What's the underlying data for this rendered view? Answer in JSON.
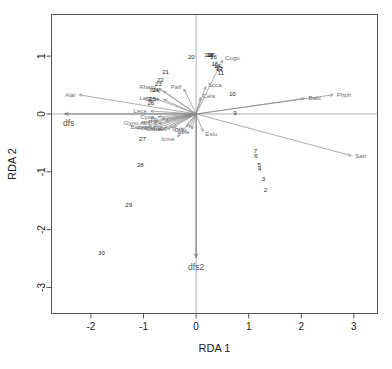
{
  "chart_data": {
    "type": "scatter",
    "title": "",
    "xlabel": "RDA 1",
    "ylabel": "RDA 2",
    "xlim": [
      -2.75,
      3.45
    ],
    "ylim": [
      -3.45,
      1.72
    ],
    "xticks": [
      "-2",
      "-1",
      "0",
      "1",
      "2",
      "3"
    ],
    "xtick_values": [
      -2,
      -1,
      0,
      1,
      2,
      3
    ],
    "yticks": [
      "1",
      "0",
      "-1",
      "-2",
      "-3"
    ],
    "ytick_values": [
      1,
      0,
      -1,
      -2,
      -3
    ],
    "grid": false,
    "legend": "none",
    "zero_lines": true,
    "sites": [
      {
        "label": "1",
        "x": 0.3,
        "y": 1.02
      },
      {
        "label": "2",
        "x": 1.32,
        "y": -1.3
      },
      {
        "label": "3",
        "x": 1.28,
        "y": -1.12
      },
      {
        "label": "4",
        "x": 1.21,
        "y": -0.94
      },
      {
        "label": "5",
        "x": 1.2,
        "y": -0.88
      },
      {
        "label": "6",
        "x": 1.14,
        "y": -0.71
      },
      {
        "label": "7",
        "x": 1.13,
        "y": -0.63
      },
      {
        "label": "9",
        "x": 0.74,
        "y": 0.02
      },
      {
        "label": "10",
        "x": 0.69,
        "y": 0.36
      },
      {
        "label": "11",
        "x": 0.47,
        "y": 0.72
      },
      {
        "label": "12",
        "x": 0.45,
        "y": 0.78
      },
      {
        "label": "13",
        "x": 0.43,
        "y": 0.81
      },
      {
        "label": "14",
        "x": 0.4,
        "y": 0.84
      },
      {
        "label": "15",
        "x": 0.36,
        "y": 0.88
      },
      {
        "label": "16",
        "x": 0.33,
        "y": 1.0
      },
      {
        "label": "17",
        "x": 0.29,
        "y": 1.02
      },
      {
        "label": "18",
        "x": 0.26,
        "y": 1.03
      },
      {
        "label": "19",
        "x": 0.22,
        "y": 1.02
      },
      {
        "label": "20",
        "x": -0.09,
        "y": 0.99
      },
      {
        "label": "21",
        "x": -0.58,
        "y": 0.73
      },
      {
        "label": "22",
        "x": -0.68,
        "y": 0.6
      },
      {
        "label": "23",
        "x": -0.72,
        "y": 0.52
      },
      {
        "label": "24",
        "x": -0.77,
        "y": 0.42
      },
      {
        "label": "25",
        "x": -0.83,
        "y": 0.26
      },
      {
        "label": "26",
        "x": -0.86,
        "y": 0.2
      },
      {
        "label": "27",
        "x": -1.02,
        "y": -0.43
      },
      {
        "label": "28",
        "x": -1.06,
        "y": -0.88
      },
      {
        "label": "29",
        "x": -1.28,
        "y": -1.56
      },
      {
        "label": "30",
        "x": -1.8,
        "y": -2.4
      }
    ],
    "species": [
      {
        "label": "Alal",
        "x": -2.22,
        "y": 0.33
      },
      {
        "label": "Phph",
        "x": 2.6,
        "y": 0.33
      },
      {
        "label": "Babl",
        "x": 2.06,
        "y": 0.27
      },
      {
        "label": "Satr",
        "x": 2.95,
        "y": -0.72
      },
      {
        "label": "Cogo",
        "x": 0.5,
        "y": 0.93
      },
      {
        "label": "Scca",
        "x": 0.18,
        "y": 0.47
      },
      {
        "label": "Pafl",
        "x": -0.23,
        "y": 0.43
      },
      {
        "label": "Cela",
        "x": 0.08,
        "y": 0.28
      },
      {
        "label": "Eslu",
        "x": 0.13,
        "y": -0.3
      },
      {
        "label": "Icme",
        "x": -0.35,
        "y": -0.39
      },
      {
        "label": "Rham",
        "x": -0.7,
        "y": 0.44
      },
      {
        "label": "Blbj",
        "x": -0.62,
        "y": 0.4
      },
      {
        "label": "Legi",
        "x": -0.78,
        "y": 0.27
      },
      {
        "label": "Gyce",
        "x": -0.62,
        "y": 0.25
      },
      {
        "label": "Lece",
        "x": -0.86,
        "y": 0.05
      },
      {
        "label": "Cyca",
        "x": -0.72,
        "y": -0.05
      },
      {
        "label": "Titi",
        "x": -0.65,
        "y": -0.08
      },
      {
        "label": "Gyno",
        "x": -1.02,
        "y": -0.15
      },
      {
        "label": "Albi",
        "x": -0.8,
        "y": -0.14
      },
      {
        "label": "Ruru",
        "x": -0.58,
        "y": -0.12
      },
      {
        "label": "Baba",
        "x": -0.9,
        "y": -0.21
      },
      {
        "label": "Abbr",
        "x": -0.8,
        "y": -0.22
      },
      {
        "label": "Pefl",
        "x": -0.7,
        "y": -0.23
      },
      {
        "label": "Chna",
        "x": -0.6,
        "y": -0.24
      },
      {
        "label": "Anan",
        "x": -0.5,
        "y": -0.23
      },
      {
        "label": "Sqce",
        "x": -0.42,
        "y": -0.22
      },
      {
        "label": "Thth",
        "x": -0.18,
        "y": -0.22
      },
      {
        "label": "Cyto",
        "x": -0.13,
        "y": -0.24
      },
      {
        "label": "Lele",
        "x": -0.08,
        "y": -0.26
      }
    ],
    "constraints": [
      {
        "label": "dfs",
        "x": -2.5,
        "y": 0.0
      },
      {
        "label": "dfs2",
        "x": 0.0,
        "y": -2.48
      }
    ]
  }
}
